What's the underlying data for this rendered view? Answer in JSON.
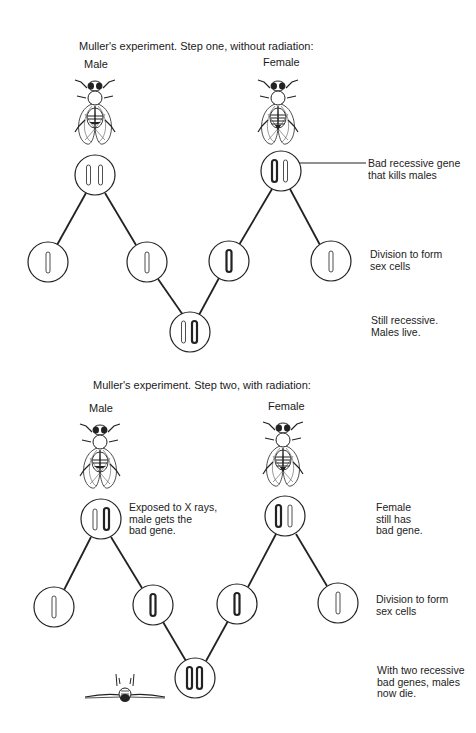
{
  "step_one": {
    "title": "Muller's experiment.  Step one, without radiation:",
    "male_label": "Male",
    "female_label": "Female",
    "annotations": {
      "bad_gene": "Bad recessive gene\nthat kills males",
      "division": "Division to form\nsex cells",
      "result": "Still recessive.\nMales live."
    },
    "cells": [
      {
        "id": "male-parent",
        "cx": 95,
        "cy": 175,
        "chromosomes": [
          "normal",
          "normal"
        ]
      },
      {
        "id": "female-parent",
        "cx": 281,
        "cy": 171,
        "chromosomes": [
          "bad",
          "normal"
        ]
      },
      {
        "id": "male-gamete-1",
        "cx": 48,
        "cy": 262,
        "chromosomes": [
          "normal"
        ]
      },
      {
        "id": "male-gamete-2",
        "cx": 147,
        "cy": 262,
        "chromosomes": [
          "normal"
        ]
      },
      {
        "id": "female-gamete-1",
        "cx": 229,
        "cy": 261,
        "chromosomes": [
          "bad"
        ]
      },
      {
        "id": "female-gamete-2",
        "cx": 331,
        "cy": 261,
        "chromosomes": [
          "normal"
        ]
      },
      {
        "id": "offspring",
        "cx": 190,
        "cy": 332,
        "chromosomes": [
          "normal",
          "bad"
        ]
      }
    ]
  },
  "step_two": {
    "title": "Muller's experiment. Step two, with radiation:",
    "male_label": "Male",
    "female_label": "Female",
    "annotations": {
      "x_rays": "Exposed to X rays,\nmale gets the\nbad gene.",
      "female_still": "Female\nstill has\nbad gene.",
      "division": "Division to form\nsex cells",
      "result": "With two recessive\nbad genes, males\nnow die."
    },
    "cells": [
      {
        "id": "male-parent",
        "cx": 101,
        "cy": 519,
        "chromosomes": [
          "normal",
          "bad"
        ]
      },
      {
        "id": "female-parent",
        "cx": 285,
        "cy": 516,
        "chromosomes": [
          "bad",
          "normal"
        ]
      },
      {
        "id": "male-gamete-1",
        "cx": 54,
        "cy": 607,
        "chromosomes": [
          "normal"
        ]
      },
      {
        "id": "male-gamete-2",
        "cx": 153,
        "cy": 605,
        "chromosomes": [
          "bad"
        ]
      },
      {
        "id": "female-gamete-1",
        "cx": 237,
        "cy": 604,
        "chromosomes": [
          "bad"
        ]
      },
      {
        "id": "female-gamete-2",
        "cx": 338,
        "cy": 603,
        "chromosomes": [
          "normal"
        ]
      },
      {
        "id": "offspring",
        "cx": 195,
        "cy": 678,
        "chromosomes": [
          "bad",
          "bad"
        ]
      }
    ]
  },
  "icons": {
    "male_fly": "fruit-fly-male",
    "female_fly": "fruit-fly-female",
    "dead_fly": "dead-fruit-fly"
  }
}
